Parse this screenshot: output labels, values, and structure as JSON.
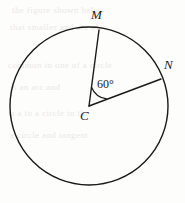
{
  "figure": {
    "type": "circle-with-central-angle",
    "background_color": "#fdfdfb",
    "stroke_color": "#1a1a1a",
    "circle": {
      "center_label": "C",
      "center_x": 89,
      "center_y": 106,
      "radius": 79
    },
    "points": [
      {
        "label": "M",
        "x": 99,
        "y": 30,
        "label_x": 91,
        "label_y": 8
      },
      {
        "label": "N",
        "x": 161,
        "y": 79,
        "label_x": 164,
        "label_y": 58
      },
      {
        "label": "C",
        "x": 89,
        "y": 106,
        "label_x": 80,
        "label_y": 109
      }
    ],
    "radii": [
      {
        "name": "CM",
        "from": "C",
        "to": "M"
      },
      {
        "name": "CN",
        "from": "C",
        "to": "N"
      }
    ],
    "angle": {
      "vertex": "C",
      "rays": [
        "CM",
        "CN"
      ],
      "value": "60°",
      "arc_radius": 19,
      "label_x": 97,
      "label_y": 78
    }
  },
  "background_artifacts": {
    "visible": true,
    "lines": [
      {
        "text": "the figure shown below",
        "x": 12,
        "y": 5
      },
      {
        "text": "that smaller and are also",
        "x": 10,
        "y": 22
      },
      {
        "text": "common in one of a circle",
        "x": 8,
        "y": 60
      },
      {
        "text": "is an arc and",
        "x": 10,
        "y": 82
      },
      {
        "text": "is a to a circle in the",
        "x": 8,
        "y": 108
      },
      {
        "text": "a circle and tangent",
        "x": 10,
        "y": 130
      }
    ]
  }
}
